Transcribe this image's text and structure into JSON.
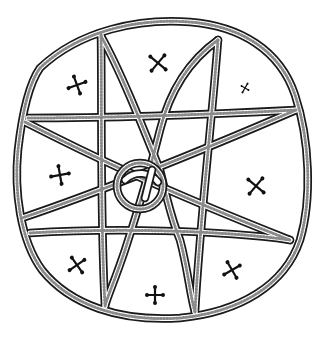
{
  "figure": {
    "title": "Circular ornament with eight-pointed star and cross motifs",
    "background": "#ffffff",
    "ink_color": "#1a1a1a",
    "texture_color": "#8a8a8a",
    "outer_ring": {
      "cx": 163,
      "cy": 168,
      "rx": 145,
      "ry": 147
    },
    "center_ring": {
      "cx": 140,
      "cy": 186,
      "r": 23
    },
    "cross_motifs": [
      {
        "id": "cross-top-left",
        "x": 77,
        "y": 85,
        "size": 9
      },
      {
        "id": "cross-top-center",
        "x": 158,
        "y": 63,
        "size": 10
      },
      {
        "id": "cross-top-right-small",
        "x": 245,
        "y": 88,
        "size": 5
      },
      {
        "id": "cross-left",
        "x": 60,
        "y": 175,
        "size": 9
      },
      {
        "id": "cross-right",
        "x": 256,
        "y": 186,
        "size": 10
      },
      {
        "id": "cross-bottom-left",
        "x": 77,
        "y": 265,
        "size": 9
      },
      {
        "id": "cross-bottom-center",
        "x": 155,
        "y": 295,
        "size": 8
      },
      {
        "id": "cross-bottom-right",
        "x": 232,
        "y": 270,
        "size": 9
      }
    ]
  }
}
